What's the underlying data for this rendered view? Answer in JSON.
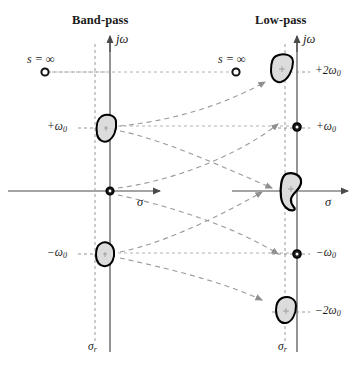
{
  "figure": {
    "type": "pole-zero-mapping-diagram",
    "panels": [
      {
        "id": "band-pass",
        "title": "Band-pass",
        "imag_axis_label": "jω",
        "real_axis_label": "σ",
        "vertical_dashed_label": "σr",
        "infinity_label": "s = ∞",
        "markers": [
          {
            "name": "s-infinity-marker",
            "kind": "open-circle",
            "label": "s = ∞",
            "omega": "∞"
          },
          {
            "name": "positive-omega0-blob",
            "kind": "blob",
            "label": "+ω0",
            "omega": "+ω0"
          },
          {
            "name": "origin-marker",
            "kind": "filled-circle",
            "label": "",
            "omega": "0"
          },
          {
            "name": "negative-omega0-blob",
            "kind": "blob",
            "label": "-ω0",
            "omega": "-ω0"
          }
        ],
        "tick_labels": [
          "+ω0",
          "-ω0"
        ]
      },
      {
        "id": "low-pass",
        "title": "Low-pass",
        "imag_axis_label": "jω",
        "real_axis_label": "σ",
        "vertical_dashed_label": "σr",
        "infinity_label": "s = ∞",
        "markers": [
          {
            "name": "plus-2omega0-blob",
            "kind": "blob",
            "label": "+2ω0",
            "omega": "+2ω0"
          },
          {
            "name": "plus-omega0-marker",
            "kind": "dotted-circle",
            "label": "+ω0",
            "omega": "+ω0"
          },
          {
            "name": "origin-blob",
            "kind": "blob",
            "label": "",
            "omega": "0"
          },
          {
            "name": "minus-omega0-marker",
            "kind": "dotted-circle",
            "label": "-ω0",
            "omega": "-ω0"
          },
          {
            "name": "minus-2omega0-blob",
            "kind": "blob",
            "label": "-2ω0",
            "omega": "-2ω0"
          },
          {
            "name": "s-infinity-marker",
            "kind": "open-circle",
            "label": "s = ∞",
            "omega": "∞"
          }
        ],
        "tick_labels": [
          "+2ω0",
          "+ω0",
          "-ω0",
          "-2ω0"
        ]
      }
    ],
    "greek": {
      "omega": "ω",
      "sigma": "σ",
      "j_omega": "jω",
      "infinity": "∞",
      "s": "s",
      "equals": "="
    },
    "labels": {
      "bandpass_title": "Band-pass",
      "lowpass_title": "Low-pass",
      "s_infinity": "s = ∞",
      "plus_omega0": "+ω",
      "minus_omega0": "−ω",
      "plus_2omega0": "+2ω",
      "minus_2omega0": "−2ω",
      "zero_sub": "0",
      "sigma_axis": "σ",
      "jomega_axis": "jω",
      "sigma_r": "σ",
      "sigma_r_sub": "r"
    },
    "colors": {
      "ink": "#1a1a1a",
      "axis": "#4a4a4a",
      "dashed": "#8a8a8a",
      "blob_fill": "#d9d9d9",
      "blob_stroke": "#000000",
      "background": "#ffffff"
    },
    "footer_text": ""
  }
}
